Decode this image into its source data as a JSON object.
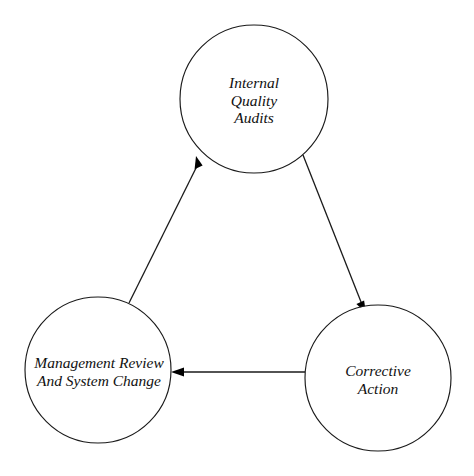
{
  "diagram": {
    "background_color": "#ffffff",
    "stroke_color": "#1a1a1a",
    "label_color": "#111111",
    "nodes": [
      {
        "id": "internal-quality-audits",
        "lines": [
          "Internal",
          "Quality",
          "Audits"
        ],
        "cx": 254,
        "cy": 99,
        "r": 74
      },
      {
        "id": "management-review-and-system-change",
        "lines": [
          "Management Review",
          "And System Change"
        ],
        "cx": 98,
        "cy": 370,
        "r": 73
      },
      {
        "id": "corrective-action",
        "lines": [
          "Corrective",
          "Action"
        ],
        "cx": 378,
        "cy": 378,
        "r": 73
      }
    ],
    "edges": [
      {
        "id": "audits-to-corrective-action",
        "from": "internal-quality-audits",
        "to": "corrective-action",
        "direction": "down-right",
        "arrowhead": "at-target"
      },
      {
        "id": "corrective-action-to-management-review",
        "from": "corrective-action",
        "to": "management-review-and-system-change",
        "direction": "left",
        "arrowhead": "at-target"
      },
      {
        "id": "management-review-to-audits",
        "from": "management-review-and-system-change",
        "to": "internal-quality-audits",
        "direction": "up-right",
        "arrowhead": "at-target"
      }
    ]
  }
}
